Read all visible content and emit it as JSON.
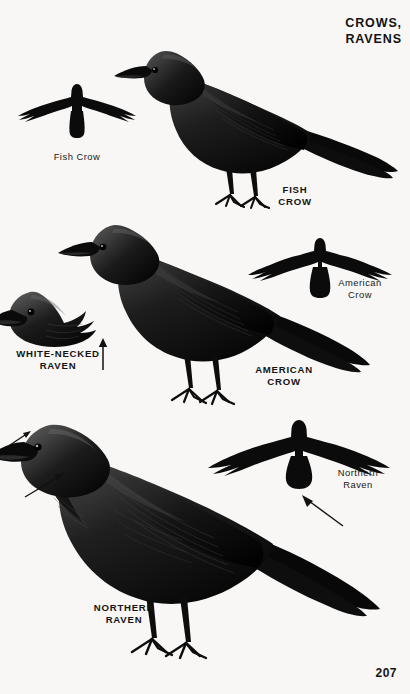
{
  "page": {
    "title": "CROWS,\nRAVENS",
    "number": "207",
    "background_color": "#f8f7f5",
    "ink_color": "#111111"
  },
  "plates": [
    {
      "id": "fish-crow-flight",
      "kind": "flight-silhouette",
      "label": "Fish Crow",
      "label_style": "light",
      "tail_shape": "squared"
    },
    {
      "id": "fish-crow-perched",
      "kind": "perched-bird",
      "label": "FISH\nCROW",
      "label_style": "bold"
    },
    {
      "id": "american-crow-flight",
      "kind": "flight-silhouette",
      "label": "American\nCrow",
      "label_style": "light",
      "tail_shape": "squared-fanned"
    },
    {
      "id": "american-crow-perched",
      "kind": "perched-bird",
      "label": "AMERICAN\nCROW",
      "label_style": "bold"
    },
    {
      "id": "white-necked-raven-head",
      "kind": "head-study",
      "label": "WHITE-NECKED\nRAVEN",
      "label_style": "bold"
    },
    {
      "id": "northern-raven-flight",
      "kind": "flight-silhouette",
      "label": "Northern\nRaven",
      "label_style": "light",
      "tail_shape": "wedge"
    },
    {
      "id": "northern-raven-perched",
      "kind": "perched-bird",
      "label": "NORTHERN\nRAVEN",
      "label_style": "bold"
    }
  ],
  "pointers": [
    {
      "id": "white-necked-raven-neck-arrow",
      "direction": "up",
      "target": "white-necked-raven-head"
    },
    {
      "id": "raven-bill-arrow",
      "direction": "up-right",
      "target": "northern-raven-bill"
    },
    {
      "id": "raven-hackles-arrow",
      "direction": "up-right",
      "target": "northern-raven-throat-hackles"
    },
    {
      "id": "raven-wedge-tail-arrow",
      "direction": "up-left",
      "target": "northern-raven-flight-tail"
    }
  ]
}
